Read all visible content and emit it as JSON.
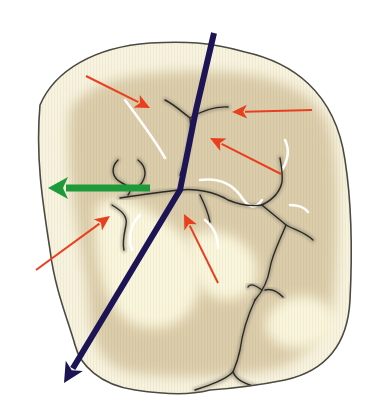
{
  "figure": {
    "width": 386,
    "height": 419,
    "background": "#ffffff"
  },
  "colors": {
    "crown_fill": "#f8f3de",
    "crown_outline": "#4a4a42",
    "inner_fossa": "#dccdaa",
    "cusp_highlight": "#faf6dc",
    "fissure": "#2b2a24",
    "fissure_shadow": "#8d8674",
    "enamel_highlight": "#ffffff",
    "red_arrow": "#e8401f",
    "green_arrow": "#1f9a3a",
    "navy_line": "#1d1456"
  },
  "outline": {
    "path": "M 40 105 C 55 70, 95 47, 150 43 C 185 41, 210 42, 245 52 C 290 62, 335 90, 345 160 C 352 205, 352 260, 350 300 C 348 340, 330 370, 285 380 C 255 386, 240 388, 210 390 C 190 395, 170 395, 135 390 C 100 385, 80 365, 75 345 C 68 320, 55 290, 50 250 C 44 210, 35 160, 40 105 Z"
  },
  "fossa_region": {
    "path": "M 70 110 C 90 75, 160 68, 230 72 C 280 76, 320 95, 330 130 C 340 170, 338 240, 335 290 C 330 330, 310 360, 270 370 C 230 378, 170 380, 130 372 C 100 365, 90 340, 88 300 C 85 250, 62 180, 70 110 Z"
  },
  "cusp_highlights": [
    {
      "name": "mesiobuccal-cusp-highlight",
      "path": "M 95 215 C 95 195, 120 195, 140 205 C 165 220, 190 235, 200 265 C 205 300, 185 330, 150 328 C 115 325, 95 290, 95 215 Z"
    },
    {
      "name": "distal-cusp-highlight",
      "path": "M 265 325 C 270 300, 300 290, 320 300 C 340 310, 338 330, 325 340 C 300 355, 270 350, 265 325 Z"
    },
    {
      "name": "central-cusp-highlight",
      "path": "M 190 235 C 215 225, 245 235, 255 260 C 262 285, 245 300, 225 300 C 200 298, 185 270, 190 235 Z"
    }
  ],
  "fissures": [
    {
      "name": "fissure-mesial-pit",
      "path": "M 165 100 C 175 105, 182 112, 190 118 C 200 112, 212 106, 228 107"
    },
    {
      "name": "fissure-central-upper",
      "path": "M 190 118 C 192 135, 188 155, 180 175"
    },
    {
      "name": "fissure-buccal-branch-a",
      "path": "M 118 160 C 110 168, 112 178, 122 183 C 130 187, 132 190, 128 195"
    },
    {
      "name": "fissure-buccal-branch-b",
      "path": "M 138 160 C 148 168, 146 178, 140 185"
    },
    {
      "name": "fissure-central-horizontal",
      "path": "M 120 198 C 140 195, 160 192, 180 190"
    },
    {
      "name": "fissure-lingual-left",
      "path": "M 112 205 C 120 210, 128 215, 126 225 C 124 235, 122 242, 124 250"
    },
    {
      "name": "fissure-center-right",
      "path": "M 180 190 C 195 188, 215 192, 228 200 C 240 205, 250 207, 262 205"
    },
    {
      "name": "fissure-center-down",
      "path": "M 200 195 C 205 205, 208 212, 210 222"
    },
    {
      "name": "fissure-right-upper",
      "path": "M 262 205 C 272 200, 280 192, 282 182 C 283 172, 281 165, 280 158"
    },
    {
      "name": "fissure-right-trifurcation",
      "path": "M 262 205 C 270 212, 278 218, 286 225 C 295 230, 305 232, 313 240"
    },
    {
      "name": "fissure-distal-main",
      "path": "M 286 225 C 280 240, 272 255, 270 268 C 268 280, 262 292, 255 300"
    },
    {
      "name": "fissure-distal-fork-left",
      "path": "M 262 290 C 255 285, 250 283, 248 287"
    },
    {
      "name": "fissure-distal-fork-right",
      "path": "M 265 290 C 272 288, 278 292, 283 297"
    },
    {
      "name": "fissure-distal-lower",
      "path": "M 255 300 C 248 315, 242 335, 240 350 C 238 360, 236 365, 233 372"
    },
    {
      "name": "fissure-distal-cusp-groove",
      "path": "M 233 372 C 236 380, 245 385, 262 388 C 275 390, 285 392, 292 393"
    },
    {
      "name": "fissure-distal-left-groove",
      "path": "M 233 372 C 225 380, 210 385, 195 390"
    }
  ],
  "enamel_highlights": [
    {
      "name": "highlight-mesial-ridge",
      "path": "M 125 100 C 140 120, 155 140, 165 158"
    },
    {
      "name": "highlight-central-loop",
      "path": "M 200 180 C 215 178, 230 182, 240 195 C 248 208, 255 210, 262 200"
    },
    {
      "name": "highlight-right-wave",
      "path": "M 285 140 C 290 150, 288 160, 282 170"
    },
    {
      "name": "highlight-left-lobe",
      "path": "M 140 215 C 130 225, 128 238, 132 250"
    },
    {
      "name": "highlight-center-lobe",
      "path": "M 205 220 C 215 228, 218 238, 218 248"
    },
    {
      "name": "highlight-right-lobe",
      "path": "M 290 205 C 300 205, 305 208, 308 212"
    }
  ],
  "annotations": {
    "red_arrows": [
      {
        "name": "red-arrow-upper-left",
        "x1": 86,
        "y1": 76,
        "x2": 150,
        "y2": 108
      },
      {
        "name": "red-arrow-upper-right",
        "x1": 312,
        "y1": 110,
        "x2": 232,
        "y2": 112
      },
      {
        "name": "red-arrow-middle-right",
        "x1": 281,
        "y1": 174,
        "x2": 210,
        "y2": 138
      },
      {
        "name": "red-arrow-lower-left",
        "x1": 36,
        "y1": 270,
        "x2": 110,
        "y2": 216
      },
      {
        "name": "red-arrow-lower-center",
        "x1": 218,
        "y1": 283,
        "x2": 184,
        "y2": 214
      }
    ],
    "green_arrow": {
      "name": "green-arrow-buccal",
      "x1": 150,
      "y1": 188,
      "x2": 48,
      "y2": 188
    },
    "navy_line": {
      "name": "navy-line-axis",
      "points": [
        [
          214,
          33
        ],
        [
          196,
          110
        ],
        [
          180,
          190
        ],
        [
          120,
          290
        ],
        [
          64,
          383
        ]
      ]
    }
  }
}
